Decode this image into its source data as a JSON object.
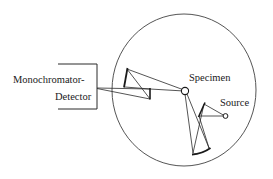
{
  "diagram": {
    "type": "optical-schematic",
    "labels": {
      "detector_line1": "Monochromator-",
      "detector_line2": "Detector",
      "specimen": "Specimen",
      "source": "Source"
    },
    "colors": {
      "stroke": "#2a2a2a",
      "circle": "#555555",
      "text": "#1a1a1a",
      "background": "#ffffff"
    },
    "components": [
      {
        "name": "Monochromator-Detector",
        "kind": "bracket-box"
      },
      {
        "name": "Specimen",
        "kind": "small-circle"
      },
      {
        "name": "Source",
        "kind": "small-circle"
      },
      {
        "name": "Collection mirror 1",
        "kind": "mirror"
      },
      {
        "name": "Collection mirror 2",
        "kind": "mirror"
      },
      {
        "name": "Illumination mirror 1",
        "kind": "mirror"
      },
      {
        "name": "Illumination mirror 2",
        "kind": "curved-mirror"
      },
      {
        "name": "Chamber",
        "kind": "large-circle"
      }
    ]
  }
}
